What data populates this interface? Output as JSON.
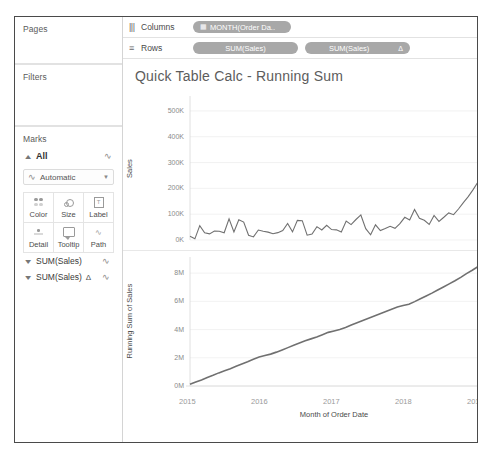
{
  "window": {
    "sidebar": {
      "pages": {
        "title": "Pages"
      },
      "filters": {
        "title": "Filters"
      },
      "marks": {
        "title": "Marks",
        "all_label": "All",
        "mark_type": "Automatic",
        "mark_type_icon": "line-mark-icon",
        "buttons": [
          {
            "label": "Color",
            "icon": "color-dots-icon"
          },
          {
            "label": "Size",
            "icon": "size-circles-icon"
          },
          {
            "label": "Label",
            "icon": "label-box-icon"
          },
          {
            "label": "Detail",
            "icon": "detail-dots-icon"
          },
          {
            "label": "Tooltip",
            "icon": "tooltip-bubble-icon"
          },
          {
            "label": "Path",
            "icon": "path-line-icon"
          }
        ]
      },
      "field_cards": [
        {
          "label": "SUM(Sales)",
          "delta": "",
          "icon": "line-mark-icon",
          "caret": "chevron-down-icon"
        },
        {
          "label": "SUM(Sales)",
          "delta": "Δ",
          "icon": "line-mark-icon",
          "caret": "chevron-down-icon"
        }
      ]
    },
    "shelves": [
      {
        "name": "Columns",
        "icon": "columns-icon",
        "pills": [
          {
            "label": "MONTH(Order Da..",
            "icon": "calendar-icon",
            "delta": ""
          }
        ]
      },
      {
        "name": "Rows",
        "icon": "rows-icon",
        "pills": [
          {
            "label": "SUM(Sales)",
            "icon": "",
            "delta": ""
          },
          {
            "label": "SUM(Sales)",
            "icon": "",
            "delta": "Δ"
          }
        ]
      }
    ],
    "viz": {
      "title": "Quick Table Calc - Running Sum"
    }
  },
  "chart_data": [
    {
      "type": "line",
      "title": "Sales by Month of Order Date",
      "ylabel": "Sales",
      "xlabel": "",
      "ylim": [
        0,
        550000
      ],
      "yticks": [
        "0K",
        "100K",
        "200K",
        "300K",
        "400K",
        "500K"
      ],
      "ytick_values": [
        0,
        100000,
        200000,
        300000,
        400000,
        500000
      ],
      "xticks": [
        "2015",
        "2016",
        "2017",
        "2018",
        "2019"
      ],
      "grid": true,
      "legend": "none",
      "series": [
        {
          "name": "SUM(Sales)",
          "color": "#707070",
          "values": [
            14236,
            4520,
            55691,
            28295,
            23648,
            34595,
            33946,
            27909,
            81777,
            31453,
            78629,
            69545,
            18174,
            11951,
            38560,
            34009,
            30428,
            24196,
            28464,
            36818,
            64106,
            31405,
            75972,
            74920,
            18542,
            22979,
            51716,
            38750,
            56988,
            40344,
            39262,
            31115,
            73410,
            59688,
            79412,
            96999,
            43971,
            20301,
            58872,
            36522,
            44261,
            52982,
            45264,
            63121,
            87867,
            77777,
            118448,
            83829,
            76269,
            60000,
            95000,
            72000,
            88000,
            105000,
            98000,
            120000,
            145000,
            168000,
            195000,
            225000
          ]
        }
      ]
    },
    {
      "type": "line",
      "title": "Running Sum of Sales by Month of Order Date",
      "ylabel": "Running Sum of Sales",
      "xlabel": "Month of Order Date",
      "ylim": [
        0,
        9000000
      ],
      "yticks": [
        "0M",
        "2M",
        "4M",
        "6M",
        "8M"
      ],
      "ytick_values": [
        0,
        2000000,
        4000000,
        6000000,
        8000000
      ],
      "xticks": [
        "2015",
        "2016",
        "2017",
        "2018",
        "2019"
      ],
      "grid": true,
      "legend": "none",
      "series": [
        {
          "name": "Running Sum of SUM(Sales)",
          "color": "#707070",
          "values": [
            120000,
            280000,
            430000,
            600000,
            760000,
            930000,
            1080000,
            1230000,
            1400000,
            1560000,
            1720000,
            1900000,
            2060000,
            2160000,
            2260000,
            2400000,
            2560000,
            2720000,
            2880000,
            3040000,
            3200000,
            3340000,
            3480000,
            3640000,
            3800000,
            3900000,
            4000000,
            4150000,
            4320000,
            4480000,
            4640000,
            4800000,
            4960000,
            5120000,
            5280000,
            5440000,
            5600000,
            5700000,
            5800000,
            5980000,
            6180000,
            6380000,
            6580000,
            6800000,
            7020000,
            7240000,
            7460000,
            7700000,
            7960000,
            8200000,
            8460000
          ]
        }
      ]
    }
  ]
}
